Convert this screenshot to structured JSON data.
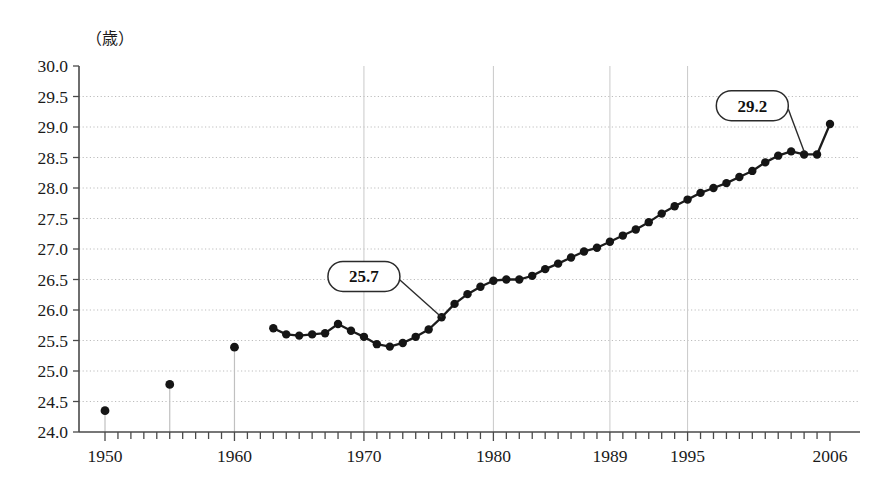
{
  "chart_data": {
    "type": "line",
    "title": "",
    "subtitle": "",
    "xlabel": "",
    "ylabel": "",
    "unit_label": "（歳）",
    "grid": true,
    "legend": "none",
    "xlim": [
      1949,
      2007
    ],
    "ylim": [
      24.0,
      30.0
    ],
    "y_ticks": [
      "30.0",
      "29.5",
      "29.0",
      "28.5",
      "28.0",
      "27.5",
      "27.0",
      "26.5",
      "26.0",
      "25.5",
      "25.0",
      "24.5",
      "24.0"
    ],
    "y_tick_values": [
      30.0,
      29.5,
      29.0,
      28.5,
      28.0,
      27.5,
      27.0,
      26.5,
      26.0,
      25.5,
      25.0,
      24.5,
      24.0
    ],
    "x_ticks": [
      "1950",
      "1960",
      "1970",
      "1980",
      "1989",
      "1995",
      "2006"
    ],
    "x_tick_values": [
      1950,
      1960,
      1970,
      1980,
      1989,
      1995,
      2006
    ],
    "x_minor_tick_step": 1,
    "vertical_reference_years": [
      1950,
      1955,
      1960,
      1970,
      1980,
      1989,
      1995
    ],
    "isolated_points": [
      {
        "x": 1950,
        "y": 24.35
      },
      {
        "x": 1955,
        "y": 24.78
      },
      {
        "x": 1960,
        "y": 25.39
      }
    ],
    "x": [
      1963,
      1964,
      1965,
      1966,
      1967,
      1968,
      1969,
      1970,
      1971,
      1972,
      1973,
      1974,
      1975,
      1976,
      1977,
      1978,
      1979,
      1980,
      1981,
      1982,
      1983,
      1984,
      1985,
      1986,
      1987,
      1988,
      1989,
      1990,
      1991,
      1992,
      1993,
      1994,
      1995,
      1996,
      1997,
      1998,
      1999,
      2000,
      2001,
      2002,
      2003,
      2004,
      2005,
      2006
    ],
    "values": [
      25.7,
      25.6,
      25.58,
      25.6,
      25.62,
      25.77,
      25.66,
      25.56,
      25.44,
      25.4,
      25.46,
      25.56,
      25.68,
      25.88,
      26.1,
      26.26,
      26.38,
      26.48,
      26.5,
      26.5,
      26.56,
      26.67,
      26.76,
      26.86,
      26.96,
      27.02,
      27.12,
      27.22,
      27.32,
      27.44,
      27.58,
      27.7,
      27.81,
      27.92,
      28.0,
      28.08,
      28.18,
      28.28,
      28.42,
      28.57,
      28.55,
      29.05,
      28.55,
      29.05
    ],
    "series": [
      {
        "name": "平均初婚年齢",
        "x": [
          1963,
          1964,
          1965,
          1966,
          1967,
          1968,
          1969,
          1970,
          1971,
          1972,
          1973,
          1974,
          1975,
          1976,
          1977,
          1978,
          1979,
          1980,
          1981,
          1982,
          1983,
          1984,
          1985,
          1986,
          1987,
          1988,
          1989,
          1990,
          1991,
          1992,
          1993,
          1994,
          1995,
          1996,
          1997,
          1998,
          1999,
          2000,
          2001,
          2002,
          2003,
          2004,
          2005,
          2006
        ],
        "values": [
          25.7,
          25.6,
          25.58,
          25.6,
          25.62,
          25.77,
          25.66,
          25.56,
          25.44,
          25.4,
          25.46,
          25.56,
          25.68,
          25.88,
          26.1,
          26.26,
          26.38,
          26.48,
          26.5,
          26.5,
          26.56,
          26.67,
          26.76,
          26.86,
          26.96,
          27.02,
          27.12,
          27.22,
          27.32,
          27.44,
          27.58,
          27.7,
          27.81,
          27.92,
          28.0,
          28.08,
          28.18,
          28.28,
          28.42,
          28.53,
          28.6,
          28.55,
          28.55,
          29.05
        ]
      }
    ],
    "annotations": [
      {
        "label": "25.7",
        "x": 1976,
        "y": 25.88,
        "box_x": 1970.0,
        "box_y": 26.55
      },
      {
        "label": "29.2",
        "x": 2004,
        "y": 28.6,
        "box_x": 2000.0,
        "box_y": 29.35
      }
    ]
  }
}
